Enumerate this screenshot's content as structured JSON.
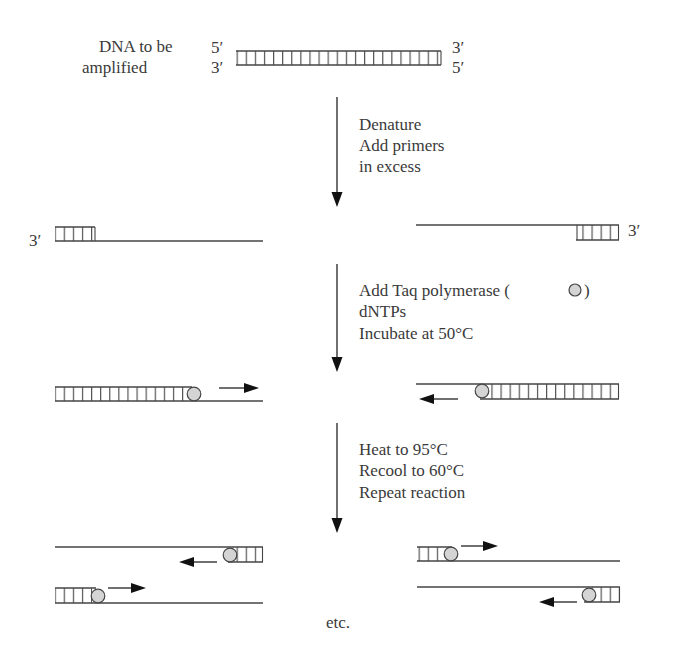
{
  "colors": {
    "line": "#444444",
    "text": "#3a3a3a",
    "polymerase_fill": "#d4d4d4",
    "arrowhead": "#111111",
    "background": "#ffffff"
  },
  "start": {
    "label_line1": "DNA to be",
    "label_line2": "amplified",
    "left_top_end": "5′",
    "left_bottom_end": "3′",
    "right_top_end": "3′",
    "right_bottom_end": "5′"
  },
  "steps": [
    {
      "id": "step-1",
      "lines": [
        "Denature",
        "Add primers",
        "in excess"
      ]
    },
    {
      "id": "step-2",
      "lines": [
        "Add Taq polymerase (",
        "dNTPs",
        "Incubate at 50°C"
      ],
      "polymerase_symbol_after_line1": ")"
    },
    {
      "id": "step-3",
      "lines": [
        "Heat to 95°C",
        "Recool to 60°C",
        "Repeat reaction"
      ]
    }
  ],
  "primer_stage": {
    "left_end_label": "3′",
    "right_end_label": "3′"
  },
  "footer": {
    "etc": "etc."
  },
  "icons": {
    "polymerase": "gray-circle",
    "flow_arrow": "down-arrow",
    "extension_arrow": "horizontal-arrow"
  }
}
